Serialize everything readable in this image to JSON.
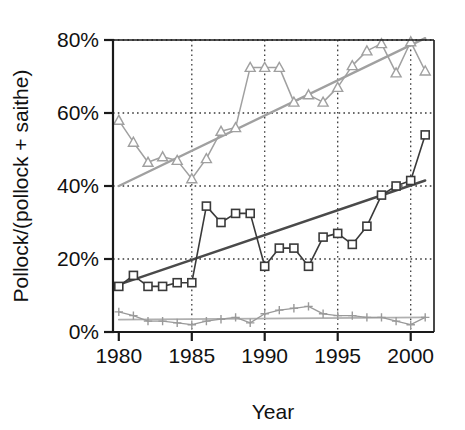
{
  "chart_data": {
    "type": "line",
    "title": "",
    "xlabel": "Year",
    "ylabel": "Pollock/(pollock + saithe)",
    "xlim": [
      1979.6,
      2001.6
    ],
    "ylim": [
      0,
      80
    ],
    "grid": true,
    "grid_style": "dotted",
    "legend": "none",
    "x_tick_labels": [
      "1980",
      "1985",
      "1990",
      "1995",
      "2000"
    ],
    "x_ticks": [
      1980,
      1985,
      1990,
      1995,
      2000
    ],
    "y_tick_labels": [
      "0%",
      "20%",
      "40%",
      "60%",
      "80%"
    ],
    "y_ticks": [
      0,
      20,
      40,
      60,
      80
    ],
    "x": [
      1980,
      1981,
      1982,
      1983,
      1984,
      1985,
      1986,
      1987,
      1988,
      1989,
      1990,
      1991,
      1992,
      1993,
      1994,
      1995,
      1996,
      1997,
      1998,
      1999,
      2000,
      2001
    ],
    "series": [
      {
        "name": "triangle-series",
        "marker": "triangle",
        "color": "#a0a0a0",
        "values": [
          58,
          52,
          46.5,
          48,
          47,
          42,
          47.5,
          55,
          56,
          72.5,
          72.5,
          72.5,
          63,
          65,
          63,
          67,
          73,
          77,
          79,
          71,
          79.5,
          71.5
        ]
      },
      {
        "name": "square-series",
        "marker": "square",
        "color": "#3a3a3a",
        "values": [
          12.5,
          15.5,
          12.5,
          12.5,
          13.5,
          13.5,
          34.5,
          30,
          32.5,
          32.5,
          18,
          23,
          23,
          18,
          26,
          27,
          24,
          29,
          37.5,
          40,
          41.5,
          54
        ]
      },
      {
        "name": "plus-series",
        "marker": "plus",
        "color": "#9a9a9a",
        "values": [
          5.5,
          4.5,
          3,
          3,
          2.5,
          2,
          3,
          3.5,
          4,
          2.5,
          5,
          6,
          6.5,
          7,
          5,
          4.5,
          4.5,
          4,
          4,
          3,
          2,
          4
        ]
      }
    ],
    "trend_lines": [
      {
        "name": "triangle-trend",
        "color": "#a0a0a0",
        "x": [
          1980,
          2001
        ],
        "y": [
          40,
          80.5
        ]
      },
      {
        "name": "square-trend",
        "color": "#4a4a4a",
        "x": [
          1980,
          2001
        ],
        "y": [
          13,
          41.5
        ]
      },
      {
        "name": "plus-trend",
        "color": "#b0b0b0",
        "x": [
          1980,
          2001
        ],
        "y": [
          3.4,
          4.0
        ]
      }
    ]
  }
}
